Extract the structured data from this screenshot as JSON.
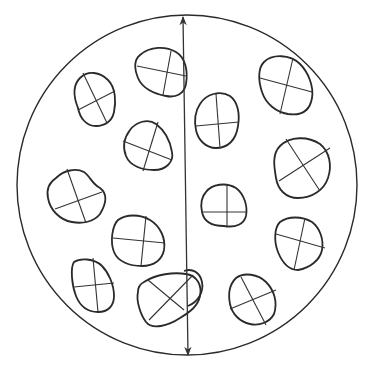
{
  "diagram": {
    "title": "",
    "colors": {
      "line": "#2a2a2a",
      "background": "#ffffff"
    },
    "field_of_view": {
      "cx": 187,
      "cy": 185,
      "r": 170
    },
    "diameter_arrow": {
      "x1": 183,
      "y1": 17,
      "x2": 188,
      "y2": 355
    },
    "particles": [
      {
        "id": "p1",
        "path": "M80,78 C88,70 100,72 108,80 C116,88 116,102 114,112 C112,122 104,126 96,126 C86,126 80,118 78,108 C74,98 72,86 80,78 Z",
        "axes": [
          [
            83,
            73,
            107,
            123
          ],
          [
            78,
            110,
            115,
            91
          ]
        ]
      },
      {
        "id": "p2",
        "path": "M140,55 C150,46 166,46 176,52 C186,58 188,72 186,84 C184,94 176,98 166,96 C154,94 142,88 138,78 C134,68 134,60 140,55 Z",
        "axes": [
          [
            137,
            66,
            186,
            76
          ],
          [
            171,
            51,
            163,
            95
          ]
        ]
      },
      {
        "id": "p3",
        "path": "M264,62 C272,54 290,54 300,64 C308,72 314,86 312,98 C310,110 302,116 288,114 C276,112 266,104 262,92 C258,80 258,68 264,62 Z",
        "axes": [
          [
            260,
            78,
            312,
            92
          ],
          [
            293,
            58,
            280,
            114
          ]
        ]
      },
      {
        "id": "p4",
        "path": "M200,104 C206,94 220,90 230,96 C238,102 240,114 238,126 C236,140 228,148 216,148 C206,148 198,140 196,130 C194,120 196,110 200,104 Z",
        "axes": [
          [
            196,
            126,
            239,
            122
          ],
          [
            216,
            94,
            220,
            148
          ]
        ]
      },
      {
        "id": "p5",
        "path": "M130,130 C136,122 148,118 156,124 C164,130 170,140 172,152 C174,162 166,170 154,170 C142,170 130,166 126,156 C122,146 124,138 130,130 Z",
        "axes": [
          [
            123,
            141,
            172,
            160
          ],
          [
            158,
            122,
            143,
            171
          ]
        ]
      },
      {
        "id": "p6",
        "path": "M280,146 C290,136 308,136 320,144 C330,152 332,166 328,178 C324,190 312,198 298,198 C286,198 278,190 276,178 C274,166 272,154 280,146 Z",
        "axes": [
          [
            286,
            139,
            320,
            191
          ],
          [
            279,
            181,
            330,
            148
          ]
        ]
      },
      {
        "id": "p7",
        "path": "M56,178 C64,170 76,168 84,172 C90,176 92,184 100,188 C108,194 106,204 100,214 C94,222 82,224 72,222 C60,220 50,210 48,198 C46,188 50,182 56,178 Z",
        "axes": [
          [
            67,
            169,
            86,
            223
          ],
          [
            55,
            209,
            102,
            192
          ]
        ]
      },
      {
        "id": "p8",
        "path": "M206,192 C212,184 226,182 236,188 C244,194 248,206 246,216 C244,224 236,228 224,226 C212,226 204,222 202,212 C200,204 202,196 206,192 Z",
        "axes": [
          [
            202,
            212,
            247,
            212
          ],
          [
            227,
            184,
            227,
            226
          ]
        ]
      },
      {
        "id": "p9",
        "path": "M118,220 C126,214 140,214 150,220 C160,226 166,238 164,250 C162,260 154,266 142,266 C130,266 118,262 114,252 C110,242 112,226 118,220 Z",
        "axes": [
          [
            113,
            238,
            165,
            243
          ],
          [
            146,
            216,
            141,
            266
          ]
        ]
      },
      {
        "id": "p10",
        "path": "M280,222 C288,216 302,216 312,222 C320,228 324,240 322,250 C320,260 310,268 298,270 C288,270 282,262 278,252 C274,242 274,228 280,222 Z",
        "axes": [
          [
            276,
            234,
            325,
            248
          ],
          [
            305,
            218,
            294,
            270
          ]
        ]
      },
      {
        "id": "p11",
        "path": "M74,262 C80,258 94,258 102,266 C108,272 114,284 114,296 C114,306 108,312 98,312 C88,312 80,306 76,296 C72,286 70,268 74,262 Z",
        "axes": [
          [
            74,
            287,
            114,
            283
          ],
          [
            93,
            258,
            98,
            312
          ]
        ]
      },
      {
        "id": "p12",
        "path": "M144,282 C156,274 174,272 186,274 C198,276 202,286 200,296 C198,306 190,312 180,318 C168,326 152,330 146,322 C140,314 136,300 138,292 C138,288 140,284 144,282 Z",
        "axes": [
          [
            148,
            280,
            184,
            310
          ],
          [
            149,
            320,
            193,
            275
          ]
        ]
      },
      {
        "id": "p13",
        "path": "M236,278 C244,272 258,274 266,282 C274,290 278,302 274,314 C270,322 260,326 250,324 C240,322 232,314 230,304 C228,294 230,284 236,278 Z",
        "axes": [
          [
            241,
            277,
            266,
            325
          ],
          [
            230,
            309,
            276,
            290
          ]
        ]
      },
      {
        "id": "p14",
        "path": "M184,271 C192,268 200,272 202,282 C204,292 198,302 188,306",
        "axes": []
      }
    ]
  }
}
